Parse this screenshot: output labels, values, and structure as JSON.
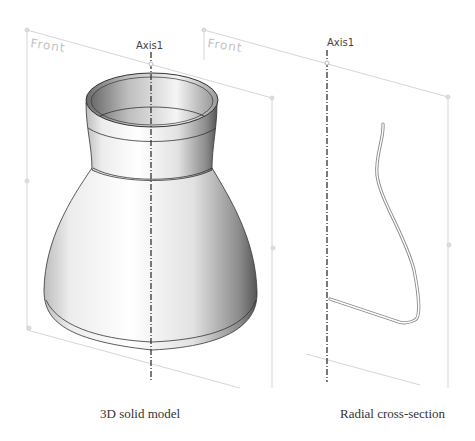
{
  "left_view": {
    "plane_label": "Front",
    "axis_label": "Axis1",
    "caption": "3D solid model"
  },
  "right_view": {
    "plane_label": "Front",
    "axis_label": "Axis1",
    "caption": "Radial cross-section"
  },
  "colors": {
    "plane_lines": "#d4d4d4",
    "axis_line": "#333333",
    "solid_highlight": "#ffffff",
    "solid_shadow": "#555555",
    "profile_stroke": "#888888"
  }
}
